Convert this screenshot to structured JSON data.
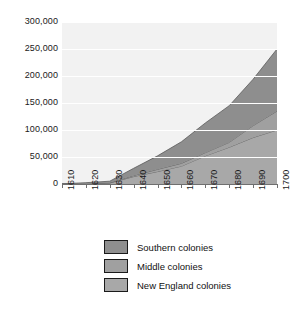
{
  "chart_data": {
    "type": "area",
    "stacked": true,
    "title": "",
    "xlabel": "",
    "ylabel": "",
    "categories": [
      1610,
      1620,
      1630,
      1640,
      1650,
      1660,
      1670,
      1680,
      1690,
      1700
    ],
    "xtick_labels": [
      "1610",
      "1620",
      "1630",
      "1640",
      "1650",
      "1660",
      "1670",
      "1680",
      "1690",
      "1700"
    ],
    "ytick_labels": [
      "0",
      "50,000",
      "100,000",
      "150,000",
      "200,000",
      "250,000",
      "300,000"
    ],
    "ytick_values": [
      0,
      50000,
      100000,
      150000,
      200000,
      250000,
      300000
    ],
    "ylim": [
      0,
      300000
    ],
    "xlim": [
      1610,
      1700
    ],
    "grid": true,
    "legend_position": "below",
    "series": [
      {
        "name": "New England colonies",
        "color": "#a8a8a8",
        "values": [
          0,
          100,
          1800,
          13700,
          23000,
          33000,
          52000,
          68000,
          86000,
          100000
        ]
      },
      {
        "name": "Middle colonies",
        "color": "#a0a0a0",
        "values": [
          0,
          0,
          400,
          1900,
          4100,
          5200,
          6000,
          9000,
          22000,
          35000
        ]
      },
      {
        "name": "Southern colonies",
        "color": "#8e8e8e",
        "values": [
          350,
          2300,
          3000,
          13500,
          25000,
          40000,
          55000,
          68000,
          86000,
          115000
        ]
      }
    ],
    "stack_totals": [
      350,
      2400,
      5200,
      29100,
      52100,
      78200,
      113000,
      145000,
      194000,
      250000
    ]
  },
  "legend": {
    "items": [
      {
        "label": "Southern colonies",
        "color": "#8e8e8e"
      },
      {
        "label": "Middle colonies",
        "color": "#a0a0a0"
      },
      {
        "label": "New England colonies",
        "color": "#a8a8a8"
      }
    ]
  },
  "colors": {
    "plot_background": "#f2f2f2",
    "gridline": "#ffffff",
    "axis": "#6f6f6f",
    "text": "#1a1a1a",
    "series_boundary": "#5a5a5a"
  }
}
